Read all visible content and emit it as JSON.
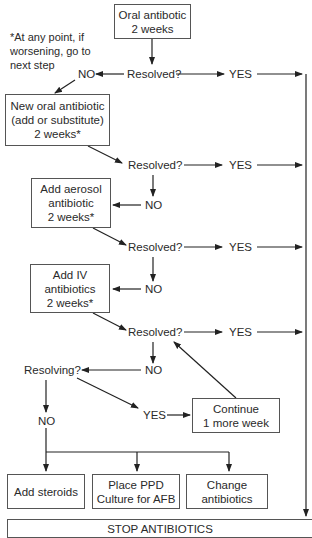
{
  "note": {
    "lines": [
      "*At any point, if",
      "worsening, go to",
      "next step"
    ]
  },
  "boxes": {
    "oral": {
      "lines": [
        "Oral antibotic",
        "2 weeks"
      ]
    },
    "new_oral": {
      "lines": [
        "New oral antibiotic",
        "(add or substitute)",
        "2 weeks*"
      ]
    },
    "aerosol": {
      "lines": [
        "Add aerosol",
        "antibiotic",
        "2 weeks*"
      ]
    },
    "iv": {
      "lines": [
        "Add IV",
        "antibiotics",
        "2 weeks*"
      ]
    },
    "continue": {
      "lines": [
        "Continue",
        "1 more week"
      ]
    },
    "steroids": {
      "lines": [
        "Add steroids"
      ]
    },
    "ppd": {
      "lines": [
        "Place PPD",
        "Culture for AFB"
      ]
    },
    "change": {
      "lines": [
        "Change",
        "antibiotics"
      ]
    },
    "stop": {
      "lines": [
        "STOP ANTIBIOTICS"
      ]
    }
  },
  "labels": {
    "resolved": "Resolved?",
    "resolving": "Resolving?",
    "yes": "YES",
    "no": "NO"
  }
}
